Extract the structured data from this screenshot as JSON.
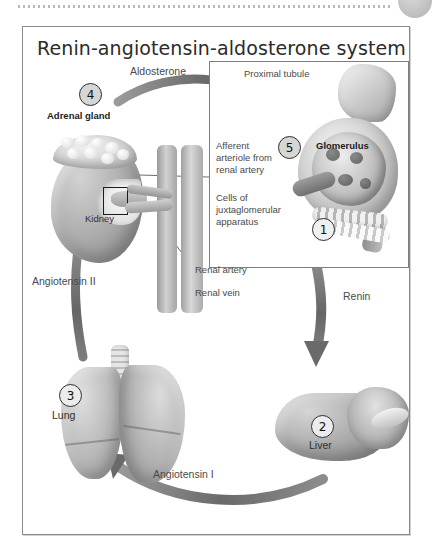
{
  "page": {
    "top_rule": "dotted-rule",
    "corner_mark": "gray-circle"
  },
  "figure": {
    "title": "Renin-angiotensin-aldosterone system",
    "border_color": "#8a8a8a",
    "background": "#ffffff"
  },
  "inset": {
    "name": "juxtaglomerular-apparatus-detail",
    "border_color": "#7e7e7e",
    "labels": {
      "proximal_tubule": "Proximal tubule",
      "glomerulus": "Glomerulus",
      "afferent_arteriole": "Afferent\narteriole from\nrenal artery",
      "jga_cells": "Cells of\njuxtaglomerular\napparatus"
    }
  },
  "steps": [
    {
      "number": "1",
      "label": "",
      "target": "juxtaglomerular-apparatus"
    },
    {
      "number": "2",
      "label": "Liver",
      "target": "liver"
    },
    {
      "number": "3",
      "label": "Lung",
      "target": "lung"
    },
    {
      "number": "4",
      "label": "Adrenal gland",
      "target": "adrenal-gland"
    },
    {
      "number": "5",
      "label": "",
      "target": "glomerulus"
    }
  ],
  "organ_labels": {
    "adrenal_gland": "Adrenal gland",
    "kidney": "Kidney",
    "lung": "Lung",
    "liver": "Liver",
    "glomerulus": "Glomerulus"
  },
  "vessel_labels": {
    "renal_artery": "Renal artery",
    "renal_vein": "Renal vein"
  },
  "pathway_labels": {
    "aldosterone": "Aldosterone",
    "renin": "Renin",
    "angiotensin_1": "Angiotensin I",
    "angiotensin_2": "Angiotensin II"
  },
  "colors": {
    "arrow_gray": "#6f6f6f",
    "text_gray": "#4a4a4a",
    "title_dark": "#2b2b2b",
    "step_fill": "#d6d6d6",
    "step_stroke": "#2e2e2e"
  }
}
